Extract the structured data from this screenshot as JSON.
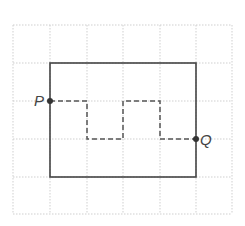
{
  "diagram": {
    "grid": {
      "x_lines": [
        13,
        50,
        87,
        123,
        160,
        196,
        232
      ],
      "y_lines": [
        25,
        63,
        101,
        139,
        177,
        214
      ],
      "color": "#cfcfcf"
    },
    "rectangle": {
      "x1": 50,
      "y1": 63,
      "x2": 196,
      "y2": 177,
      "color": "#444444"
    },
    "path": {
      "points": "50,101 87,101 87,139 123,139 123,101 160,101 160,139 196,139",
      "color": "#555555"
    },
    "points": [
      {
        "name": "P",
        "x": 50,
        "y": 101,
        "label": "P",
        "label_x": 34,
        "label_y": 106
      },
      {
        "name": "Q",
        "x": 196,
        "y": 139,
        "label": "Q",
        "label_x": 200,
        "label_y": 145
      }
    ]
  }
}
